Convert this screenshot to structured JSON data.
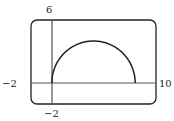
{
  "chart_data": {
    "type": "line",
    "title": "",
    "xlabel": "",
    "ylabel": "",
    "xlim": [
      -2,
      10
    ],
    "ylim": [
      -2,
      6
    ],
    "grid": false,
    "window_labels": {
      "ymax": "6",
      "ymin": "−2",
      "xmin": "−2",
      "xmax": "10"
    },
    "series": [
      {
        "name": "semicircle",
        "equation": "y = sqrt(16 - (x - 4)^2)",
        "x": [
          0,
          0.5,
          1,
          2,
          3,
          4,
          5,
          6,
          7,
          7.5,
          8
        ],
        "y": [
          0,
          1.94,
          2.65,
          3.46,
          3.87,
          4,
          3.87,
          3.46,
          2.65,
          1.94,
          0
        ]
      }
    ]
  },
  "colors": {
    "stroke": "#222222",
    "axis": "#555555",
    "background": "#ffffff"
  }
}
